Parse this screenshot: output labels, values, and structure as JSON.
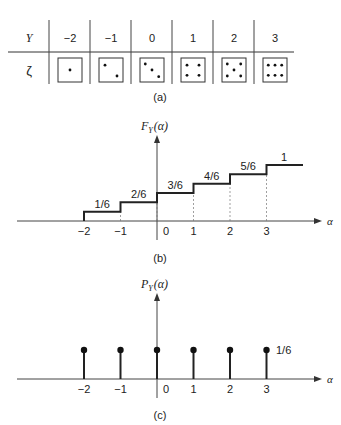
{
  "panel_a": {
    "caption": "(a)",
    "row_y_label": "Y",
    "row_zeta_label": "ζ",
    "columns": [
      {
        "y": "−2",
        "die": 1
      },
      {
        "y": "−1",
        "die": 2
      },
      {
        "y": "0",
        "die": 3
      },
      {
        "y": "1",
        "die": 4
      },
      {
        "y": "2",
        "die": 5
      },
      {
        "y": "3",
        "die": 6
      }
    ]
  },
  "panel_b": {
    "caption": "(b)",
    "ylabel_main": "F",
    "ylabel_sub": "Y",
    "ylabel_arg": "(α)",
    "xlabel": "α",
    "tick_labels": [
      "−2",
      "−1",
      "0",
      "1",
      "2",
      "3"
    ],
    "step_labels": [
      "1/6",
      "2/6",
      "3/6",
      "4/6",
      "5/6",
      "1"
    ]
  },
  "panel_c": {
    "caption": "(c)",
    "ylabel_main": "P",
    "ylabel_sub": "Y",
    "ylabel_arg": "(α)",
    "xlabel": "α",
    "tick_labels": [
      "−2",
      "−1",
      "0",
      "1",
      "2",
      "3"
    ],
    "stem_label": "1/6"
  },
  "chart_data": [
    {
      "type": "line",
      "title": "(b) CDF F_Y(α)",
      "xlabel": "α",
      "ylabel": "F_Y(α)",
      "step": true,
      "x": [
        -2,
        -1,
        0,
        1,
        2,
        3
      ],
      "values": [
        0.1667,
        0.3333,
        0.5,
        0.6667,
        0.8333,
        1.0
      ],
      "value_labels": [
        "1/6",
        "2/6",
        "3/6",
        "4/6",
        "5/6",
        "1"
      ],
      "xlim": [
        -3.5,
        4.3
      ],
      "ylim": [
        0,
        1
      ]
    },
    {
      "type": "scatter",
      "title": "(c) PMF P_Y(α)",
      "xlabel": "α",
      "ylabel": "P_Y(α)",
      "stem": true,
      "x": [
        -2,
        -1,
        0,
        1,
        2,
        3
      ],
      "values": [
        0.1667,
        0.1667,
        0.1667,
        0.1667,
        0.1667,
        0.1667
      ],
      "value_label": "1/6",
      "xlim": [
        -3.5,
        4.3
      ]
    }
  ]
}
